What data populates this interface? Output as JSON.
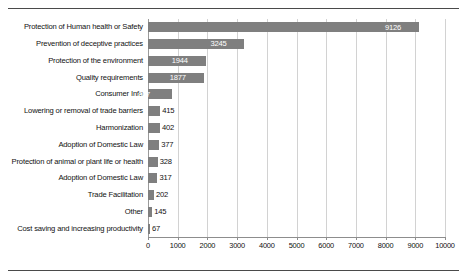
{
  "chart_data": {
    "type": "bar",
    "orientation": "horizontal",
    "title": "",
    "subtitle": "",
    "xlabel": "",
    "ylabel": "",
    "xlim": [
      0,
      10000
    ],
    "grid": true,
    "legend": "none",
    "xticks": [
      "0",
      "1000",
      "2000",
      "3000",
      "4000",
      "5000",
      "6000",
      "7000",
      "8000",
      "9000",
      "10000"
    ],
    "xtick_values": [
      0,
      1000,
      2000,
      3000,
      4000,
      5000,
      6000,
      7000,
      8000,
      9000,
      10000
    ],
    "categories": [
      "Protection of Human health or Safety",
      "Prevention of deceptive practices",
      "Protection of the environment",
      "Quality requirements",
      "Consumer Info",
      "Lowering or removal of trade barriers",
      "Harmonization",
      "Adoption of Domestic Law",
      "Protection of animal or plant life or health",
      "Adoption of Domestic Law",
      "Trade Facilitation",
      "Other",
      "Cost saving and increasing productivity"
    ],
    "values": [
      9126,
      3245,
      1944,
      1877,
      807,
      415,
      402,
      377,
      328,
      317,
      202,
      145,
      67
    ],
    "value_labels": [
      "9126",
      "3245",
      "1944",
      "1877",
      "807",
      "415",
      "402",
      "377",
      "328",
      "317",
      "202",
      "145",
      "67"
    ],
    "label_placement": [
      "inside",
      "inside",
      "inside",
      "inside",
      "inside",
      "outside",
      "outside",
      "outside",
      "outside",
      "outside",
      "outside",
      "outside",
      "outside"
    ],
    "bar_color": "#7f7f7f",
    "gridline_color": "#d2d2d2",
    "axis_color": "#8d8d8d",
    "inside_label_color": "#ffffff",
    "outside_label_color": "#111111"
  }
}
